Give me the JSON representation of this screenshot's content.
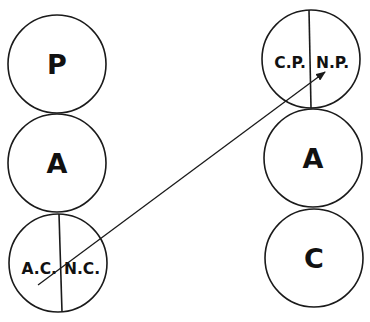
{
  "diagram": {
    "left_column": {
      "top": {
        "label": "P"
      },
      "middle": {
        "label": "A"
      },
      "bottom": {
        "left_label": "A.C.",
        "right_label": "N.C."
      }
    },
    "right_column": {
      "top": {
        "left_label": "C.P.",
        "right_label": "N.P."
      },
      "middle": {
        "label": "A"
      },
      "bottom": {
        "label": "C"
      }
    },
    "arrow": {
      "from": "A.C.",
      "to": "N.P."
    },
    "colors": {
      "stroke": "#1a1a1a",
      "background": "#ffffff"
    }
  }
}
